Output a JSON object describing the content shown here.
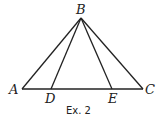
{
  "diagram": {
    "points": {
      "A": {
        "label": "A",
        "x": 22,
        "y": 89
      },
      "B": {
        "label": "B",
        "x": 81,
        "y": 18
      },
      "C": {
        "label": "C",
        "x": 143,
        "y": 89
      },
      "D": {
        "label": "D",
        "x": 51,
        "y": 89
      },
      "E": {
        "label": "E",
        "x": 112,
        "y": 89
      }
    },
    "segments": [
      [
        "A",
        "B"
      ],
      [
        "B",
        "C"
      ],
      [
        "A",
        "C"
      ],
      [
        "B",
        "D"
      ],
      [
        "B",
        "E"
      ]
    ],
    "caption": "Ex. 2",
    "line_color": "#222222"
  }
}
